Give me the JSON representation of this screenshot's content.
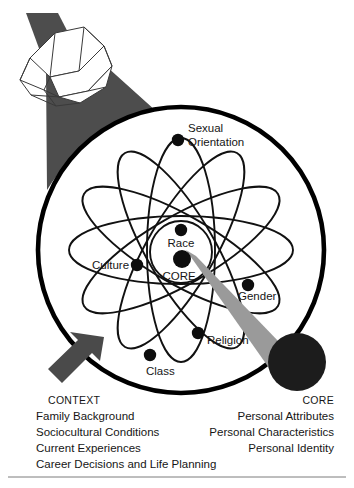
{
  "figure": {
    "type": "conceptual-diagram"
  },
  "atom": {
    "center_label_top": "Race",
    "center_label_bottom": "CORE",
    "nodes": [
      {
        "id": "sexual-orientation",
        "label": "Sexual\nOrientation",
        "line1": "Sexual",
        "line2": "Orientation"
      },
      {
        "id": "culture",
        "label": "Culture"
      },
      {
        "id": "gender",
        "label": "Gender"
      },
      {
        "id": "religion",
        "label": "Religion"
      },
      {
        "id": "class",
        "label": "Class"
      }
    ]
  },
  "captions": {
    "context": {
      "heading": "CONTEXT",
      "lines": [
        "Family Background",
        "Sociocultural Conditions",
        "Current Experiences",
        "Career Decisions and Life Planning"
      ]
    },
    "core": {
      "heading": "CORE",
      "lines": [
        "Personal Attributes",
        "Personal Characteristics",
        "Personal Identity"
      ]
    }
  },
  "colors": {
    "outline": "#000000",
    "beam_dark": "#4d4d4d",
    "beam_gray": "#9a9a9a",
    "core_disc": "#1c1c1c",
    "arrow": "#4a4a4a",
    "text": "#161616"
  }
}
